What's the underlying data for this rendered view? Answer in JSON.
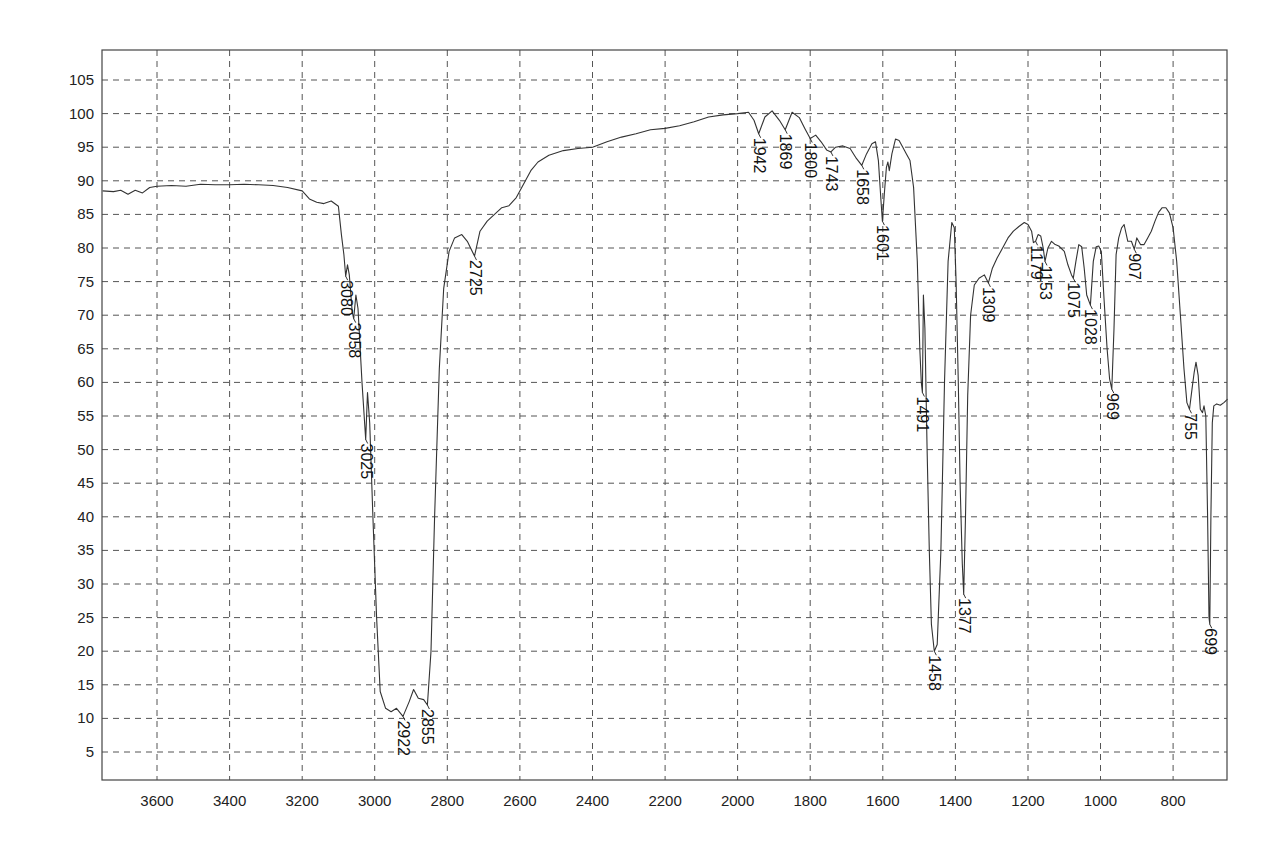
{
  "chart_data": {
    "type": "line",
    "title": "",
    "xlabel": "",
    "ylabel": "",
    "x_reversed": true,
    "xlim": [
      3750,
      650
    ],
    "ylim": [
      1,
      109
    ],
    "grid": true,
    "x_ticks": [
      3600,
      3400,
      3200,
      3000,
      2800,
      2600,
      2400,
      2200,
      2000,
      1800,
      1600,
      1400,
      1200,
      1000,
      800
    ],
    "y_ticks": [
      5,
      10,
      15,
      20,
      25,
      30,
      35,
      40,
      45,
      50,
      55,
      60,
      65,
      70,
      75,
      80,
      85,
      90,
      95,
      100,
      105
    ],
    "series": [
      {
        "name": "IR spectrum (%T)",
        "points": [
          [
            3750,
            88.5
          ],
          [
            3720,
            88.4
          ],
          [
            3700,
            88.6
          ],
          [
            3680,
            88.0
          ],
          [
            3660,
            88.6
          ],
          [
            3640,
            88.2
          ],
          [
            3620,
            89.0
          ],
          [
            3600,
            89.2
          ],
          [
            3560,
            89.3
          ],
          [
            3520,
            89.2
          ],
          [
            3480,
            89.5
          ],
          [
            3440,
            89.4
          ],
          [
            3400,
            89.4
          ],
          [
            3360,
            89.5
          ],
          [
            3320,
            89.4
          ],
          [
            3280,
            89.3
          ],
          [
            3240,
            89.0
          ],
          [
            3200,
            88.5
          ],
          [
            3180,
            87.3
          ],
          [
            3160,
            86.8
          ],
          [
            3140,
            86.6
          ],
          [
            3120,
            87.0
          ],
          [
            3100,
            86.2
          ],
          [
            3092,
            82.0
          ],
          [
            3085,
            79.0
          ],
          [
            3080,
            75.8
          ],
          [
            3075,
            77.5
          ],
          [
            3070,
            76.0
          ],
          [
            3062,
            70.5
          ],
          [
            3058,
            69.5
          ],
          [
            3052,
            73.0
          ],
          [
            3046,
            71.0
          ],
          [
            3035,
            60.0
          ],
          [
            3025,
            51.5
          ],
          [
            3020,
            58.5
          ],
          [
            3014,
            54.0
          ],
          [
            3005,
            40.0
          ],
          [
            2995,
            25.0
          ],
          [
            2985,
            14.0
          ],
          [
            2970,
            11.5
          ],
          [
            2955,
            11.0
          ],
          [
            2940,
            11.5
          ],
          [
            2922,
            10.3
          ],
          [
            2905,
            12.5
          ],
          [
            2893,
            14.3
          ],
          [
            2880,
            13.0
          ],
          [
            2865,
            12.8
          ],
          [
            2855,
            12.0
          ],
          [
            2845,
            20.0
          ],
          [
            2835,
            40.0
          ],
          [
            2822,
            62.0
          ],
          [
            2810,
            74.0
          ],
          [
            2795,
            79.5
          ],
          [
            2780,
            81.5
          ],
          [
            2760,
            82.0
          ],
          [
            2745,
            81.0
          ],
          [
            2725,
            78.8
          ],
          [
            2710,
            82.5
          ],
          [
            2690,
            84.0
          ],
          [
            2670,
            85.0
          ],
          [
            2650,
            86.0
          ],
          [
            2630,
            86.3
          ],
          [
            2610,
            87.5
          ],
          [
            2590,
            89.5
          ],
          [
            2570,
            91.5
          ],
          [
            2550,
            92.8
          ],
          [
            2520,
            93.8
          ],
          [
            2480,
            94.5
          ],
          [
            2440,
            94.8
          ],
          [
            2400,
            95.0
          ],
          [
            2360,
            95.8
          ],
          [
            2320,
            96.5
          ],
          [
            2280,
            97.0
          ],
          [
            2240,
            97.6
          ],
          [
            2200,
            97.8
          ],
          [
            2160,
            98.2
          ],
          [
            2120,
            98.8
          ],
          [
            2080,
            99.5
          ],
          [
            2040,
            99.8
          ],
          [
            2000,
            100.0
          ],
          [
            1970,
            100.2
          ],
          [
            1955,
            99.0
          ],
          [
            1942,
            97.0
          ],
          [
            1925,
            99.5
          ],
          [
            1905,
            100.4
          ],
          [
            1885,
            99.0
          ],
          [
            1869,
            97.6
          ],
          [
            1850,
            100.2
          ],
          [
            1830,
            99.4
          ],
          [
            1815,
            97.8
          ],
          [
            1800,
            96.3
          ],
          [
            1785,
            96.8
          ],
          [
            1770,
            95.8
          ],
          [
            1755,
            94.6
          ],
          [
            1743,
            94.3
          ],
          [
            1730,
            95.0
          ],
          [
            1710,
            95.2
          ],
          [
            1690,
            94.8
          ],
          [
            1675,
            93.5
          ],
          [
            1658,
            92.3
          ],
          [
            1645,
            94.0
          ],
          [
            1630,
            95.5
          ],
          [
            1620,
            95.8
          ],
          [
            1612,
            93.0
          ],
          [
            1605,
            87.0
          ],
          [
            1601,
            84.0
          ],
          [
            1596,
            88.0
          ],
          [
            1590,
            92.0
          ],
          [
            1586,
            92.8
          ],
          [
            1582,
            91.5
          ],
          [
            1575,
            94.0
          ],
          [
            1565,
            96.2
          ],
          [
            1555,
            96.0
          ],
          [
            1545,
            95.0
          ],
          [
            1535,
            94.0
          ],
          [
            1525,
            93.0
          ],
          [
            1515,
            89.0
          ],
          [
            1505,
            78.0
          ],
          [
            1498,
            65.0
          ],
          [
            1494,
            60.0
          ],
          [
            1491,
            58.5
          ],
          [
            1488,
            73.0
          ],
          [
            1484,
            68.0
          ],
          [
            1478,
            50.0
          ],
          [
            1472,
            35.0
          ],
          [
            1466,
            24.0
          ],
          [
            1458,
            20.0
          ],
          [
            1450,
            21.0
          ],
          [
            1440,
            35.0
          ],
          [
            1430,
            60.0
          ],
          [
            1420,
            78.0
          ],
          [
            1410,
            83.8
          ],
          [
            1403,
            83.0
          ],
          [
            1398,
            75.0
          ],
          [
            1392,
            60.0
          ],
          [
            1387,
            45.0
          ],
          [
            1381,
            33.0
          ],
          [
            1377,
            28.5
          ],
          [
            1372,
            40.0
          ],
          [
            1366,
            58.0
          ],
          [
            1358,
            70.0
          ],
          [
            1348,
            74.5
          ],
          [
            1335,
            75.5
          ],
          [
            1320,
            76.0
          ],
          [
            1309,
            74.8
          ],
          [
            1298,
            77.0
          ],
          [
            1285,
            78.5
          ],
          [
            1270,
            80.0
          ],
          [
            1255,
            81.5
          ],
          [
            1240,
            82.5
          ],
          [
            1225,
            83.2
          ],
          [
            1210,
            83.8
          ],
          [
            1200,
            83.5
          ],
          [
            1190,
            82.5
          ],
          [
            1185,
            80.8
          ],
          [
            1179,
            81.0
          ],
          [
            1172,
            82.0
          ],
          [
            1165,
            81.8
          ],
          [
            1158,
            80.0
          ],
          [
            1153,
            78.0
          ],
          [
            1145,
            80.0
          ],
          [
            1135,
            81.0
          ],
          [
            1125,
            80.5
          ],
          [
            1115,
            80.3
          ],
          [
            1100,
            79.5
          ],
          [
            1090,
            77.5
          ],
          [
            1080,
            76.0
          ],
          [
            1075,
            75.5
          ],
          [
            1068,
            78.0
          ],
          [
            1060,
            80.5
          ],
          [
            1052,
            80.2
          ],
          [
            1045,
            77.0
          ],
          [
            1038,
            73.0
          ],
          [
            1028,
            71.5
          ],
          [
            1020,
            78.0
          ],
          [
            1012,
            80.2
          ],
          [
            1005,
            80.3
          ],
          [
            998,
            79.5
          ],
          [
            990,
            72.0
          ],
          [
            982,
            65.0
          ],
          [
            975,
            60.5
          ],
          [
            969,
            59.0
          ],
          [
            963,
            68.0
          ],
          [
            957,
            79.0
          ],
          [
            950,
            81.5
          ],
          [
            942,
            83.0
          ],
          [
            935,
            83.5
          ],
          [
            925,
            81.0
          ],
          [
            915,
            81.0
          ],
          [
            907,
            79.8
          ],
          [
            900,
            81.5
          ],
          [
            890,
            80.5
          ],
          [
            880,
            80.5
          ],
          [
            870,
            81.5
          ],
          [
            860,
            82.5
          ],
          [
            850,
            84.0
          ],
          [
            840,
            85.3
          ],
          [
            830,
            86.0
          ],
          [
            820,
            86.0
          ],
          [
            810,
            85.2
          ],
          [
            800,
            83.0
          ],
          [
            790,
            78.0
          ],
          [
            780,
            70.0
          ],
          [
            770,
            62.0
          ],
          [
            762,
            57.0
          ],
          [
            755,
            56.0
          ],
          [
            748,
            59.0
          ],
          [
            742,
            61.5
          ],
          [
            737,
            63.0
          ],
          [
            731,
            61.0
          ],
          [
            725,
            56.0
          ],
          [
            719,
            55.5
          ],
          [
            715,
            56.5
          ],
          [
            710,
            55.0
          ],
          [
            705,
            40.0
          ],
          [
            701,
            25.0
          ],
          [
            699,
            24.0
          ],
          [
            696,
            40.0
          ],
          [
            692,
            54.0
          ],
          [
            688,
            56.5
          ],
          [
            680,
            56.8
          ],
          [
            670,
            56.6
          ],
          [
            660,
            57.0
          ],
          [
            650,
            57.5
          ]
        ]
      }
    ],
    "annotations": [
      {
        "label": "3080",
        "x": 3080,
        "y": 75.8
      },
      {
        "label": "3058",
        "x": 3058,
        "y": 69.5
      },
      {
        "label": "3025",
        "x": 3025,
        "y": 51.5
      },
      {
        "label": "2922",
        "x": 2922,
        "y": 10.3
      },
      {
        "label": "2855",
        "x": 2855,
        "y": 12.0
      },
      {
        "label": "2725",
        "x": 2725,
        "y": 78.8
      },
      {
        "label": "1942",
        "x": 1942,
        "y": 97.0
      },
      {
        "label": "1869",
        "x": 1869,
        "y": 97.6
      },
      {
        "label": "1800",
        "x": 1800,
        "y": 96.3
      },
      {
        "label": "1743",
        "x": 1743,
        "y": 94.3
      },
      {
        "label": "1658",
        "x": 1658,
        "y": 92.3
      },
      {
        "label": "1601",
        "x": 1601,
        "y": 84.0
      },
      {
        "label": "1491",
        "x": 1491,
        "y": 58.5
      },
      {
        "label": "1458",
        "x": 1458,
        "y": 20.0
      },
      {
        "label": "1377",
        "x": 1377,
        "y": 28.5
      },
      {
        "label": "1309",
        "x": 1309,
        "y": 74.8
      },
      {
        "label": "1179",
        "x": 1179,
        "y": 81.0
      },
      {
        "label": "1153",
        "x": 1153,
        "y": 78.0
      },
      {
        "label": "1075",
        "x": 1075,
        "y": 75.5
      },
      {
        "label": "1028",
        "x": 1028,
        "y": 71.5
      },
      {
        "label": "969",
        "x": 969,
        "y": 59.0
      },
      {
        "label": "907",
        "x": 907,
        "y": 79.8
      },
      {
        "label": "755",
        "x": 755,
        "y": 56.0
      },
      {
        "label": "699",
        "x": 699,
        "y": 24.0
      }
    ]
  },
  "colors": {
    "trace": "#333333",
    "grid": "#555555",
    "frame": "#444444",
    "background": "#ffffff"
  }
}
